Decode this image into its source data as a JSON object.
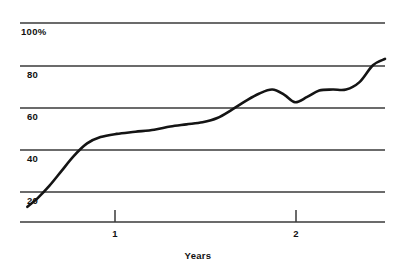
{
  "chart_data": {
    "type": "line",
    "title": "",
    "xlabel": "Years",
    "ylabel": "",
    "grid": true,
    "legend": false,
    "xlim": [
      0,
      2.72
    ],
    "ylim": [
      0,
      100
    ],
    "y_ticks": [
      {
        "value": 100,
        "label": "100%"
      },
      {
        "value": 80,
        "label": "80"
      },
      {
        "value": 60,
        "label": "60"
      },
      {
        "value": 40,
        "label": "40"
      },
      {
        "value": 20,
        "label": "20"
      }
    ],
    "x_ticks": [
      {
        "value": 1,
        "label": "1"
      },
      {
        "value": 2,
        "label": "2"
      }
    ],
    "series": [
      {
        "name": "cumulative-adoption",
        "color": "#141414",
        "x": [
          0.055,
          0.13,
          0.22,
          0.31,
          0.4,
          0.5,
          0.6,
          0.72,
          0.86,
          1.0,
          1.12,
          1.24,
          1.36,
          1.47,
          1.58,
          1.68,
          1.78,
          1.88,
          1.97,
          2.05,
          2.14,
          2.23,
          2.33,
          2.43,
          2.53,
          2.63,
          2.72
        ],
        "y": [
          13,
          17,
          23,
          30,
          37,
          43,
          46,
          47.5,
          48.5,
          49.5,
          51,
          52,
          53,
          55,
          59,
          63,
          66.5,
          68.5,
          66,
          62.5,
          65,
          68,
          68.5,
          68.5,
          72,
          80,
          83
        ]
      }
    ]
  },
  "axes": {
    "y_axis_gridline_color": "#3a3a3a",
    "x_axis_line_color": "#3a3a3a",
    "curve_color": "#141414"
  }
}
